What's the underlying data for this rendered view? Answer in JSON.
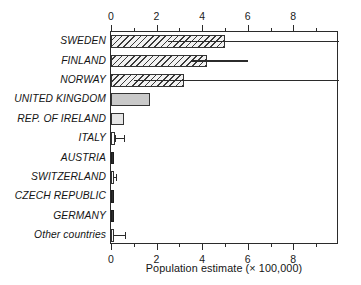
{
  "chart_data": {
    "type": "bar",
    "orientation": "horizontal",
    "title": "",
    "xlabel": "Population estimate (× 100,000)",
    "ylabel": "",
    "xlim": [
      0,
      10
    ],
    "grid": false,
    "legend": null,
    "axis_top": true,
    "axis_bottom": true,
    "major_ticks": [
      0,
      2,
      4,
      6,
      8
    ],
    "minor_ticks": [
      1,
      3,
      5,
      7,
      9
    ],
    "tick_labels_top": [
      "0",
      "2",
      "4",
      "6",
      "8"
    ],
    "tick_labels_bottom": [
      "0",
      "2",
      "4",
      "6",
      "8"
    ],
    "categories": [
      "SWEDEN",
      "FINLAND",
      "NORWAY",
      "UNITED KINGDOM",
      "REP. OF IRELAND",
      "ITALY",
      "AUSTRIA",
      "SWITZERLAND",
      "CZECH REPUBLIC",
      "GERMANY",
      "Other countries"
    ],
    "values": [
      5.0,
      4.2,
      3.2,
      1.7,
      0.55,
      0.18,
      0.15,
      0.08,
      0.09,
      0.08,
      0.1
    ],
    "fills": [
      "hatch",
      "hatch",
      "hatch",
      "gray-mid",
      "gray-light",
      "white",
      "dark",
      "white",
      "dark",
      "dark",
      "white"
    ],
    "error_bars": [
      {
        "category": "SWEDEN",
        "low": 2.5,
        "high": 10.0,
        "capped": false
      },
      {
        "category": "FINLAND",
        "low": 3.5,
        "high": 6.0,
        "capped": false
      },
      {
        "category": "NORWAY",
        "low": 1.0,
        "high": 10.0,
        "capped": false
      },
      {
        "category": "UNITED KINGDOM",
        "low": null,
        "high": null,
        "capped": false
      },
      {
        "category": "REP. OF IRELAND",
        "low": null,
        "high": null,
        "capped": false
      },
      {
        "category": "ITALY",
        "low": 0.18,
        "high": 0.55,
        "capped": true
      },
      {
        "category": "AUSTRIA",
        "low": null,
        "high": null,
        "capped": false
      },
      {
        "category": "SWITZERLAND",
        "low": 0.08,
        "high": 0.22,
        "capped": true
      },
      {
        "category": "CZECH REPUBLIC",
        "low": null,
        "high": null,
        "capped": false
      },
      {
        "category": "GERMANY",
        "low": null,
        "high": null,
        "capped": false
      },
      {
        "category": "Other countries",
        "low": 0.1,
        "high": 0.62,
        "capped": true
      }
    ]
  }
}
